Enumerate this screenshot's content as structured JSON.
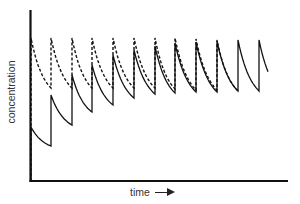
{
  "chart_data": {
    "type": "line",
    "title": "",
    "xlabel": "time",
    "ylabel": "concentration",
    "x_arrow": true,
    "grid": false,
    "legend": "none",
    "ticks": "none",
    "pixel_frame": {
      "x0": 30,
      "y0": 181,
      "x_end": 288,
      "y_top": 10
    },
    "dose_times_px": [
      31,
      51,
      72,
      92,
      113,
      134,
      155,
      175,
      196,
      217,
      238,
      259
    ],
    "end_x_px": 268,
    "series": [
      {
        "name": "loading dose (dashed)",
        "style": "dashed",
        "peaks_y_px": [
          38,
          38,
          38,
          38,
          38,
          38,
          38,
          38,
          39,
          40
        ],
        "troughs_y_px": [
          88,
          88,
          88,
          88,
          88,
          88,
          89,
          90,
          90,
          91
        ],
        "n_cycles": 9
      },
      {
        "name": "maintenance dose only (solid)",
        "style": "solid",
        "peaks_y_px": [
          127,
          95,
          75,
          65,
          55,
          50,
          46,
          43,
          42,
          41,
          40,
          40
        ],
        "troughs_y_px": [
          146,
          125,
          112,
          105,
          98,
          94,
          93,
          92,
          92,
          91,
          91
        ],
        "end_y_px": 66
      }
    ]
  }
}
